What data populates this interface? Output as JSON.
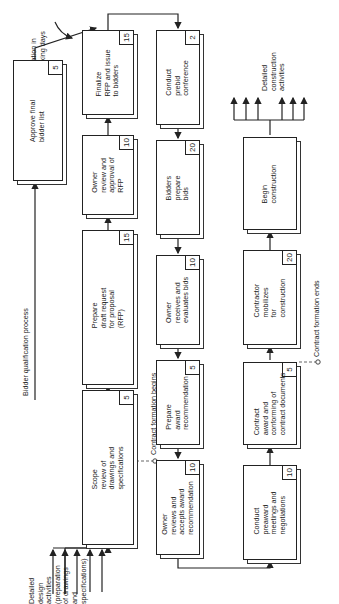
{
  "diagram": {
    "orientation": "rotated-90-ccw",
    "annotations": {
      "duration_note": "Duration in\nworking days",
      "bidder_qualification": "Bidder qualification process",
      "contract_begins": "Contract formation begins",
      "contract_ends": "Contract formation ends",
      "detailed_design": "Detailed\ndesign\nactivities\n(preparation\nof drawings\nand\nspecifications)",
      "detailed_construction": "Detailed\nconstruction\nactivities"
    },
    "activities": [
      {
        "id": "scope",
        "label": "Scope\nreview of\ndrawings and\nspecifications",
        "duration": "5"
      },
      {
        "id": "draft_rfp",
        "label": "Prepare\ndraft request\nfor proposal\n(RFP)",
        "duration": "15"
      },
      {
        "id": "owner_review_rfp",
        "label": "Owner\nreview and\napproval of\nRFP",
        "duration": "10"
      },
      {
        "id": "finalize_rfp",
        "label": "Finalize\nRFP and issue\nto bidders",
        "duration": "15"
      },
      {
        "id": "approve_bidders",
        "label": "Approve final\nbidder list",
        "duration": "5"
      },
      {
        "id": "prebid",
        "label": "Conduct\nprebid\nconference",
        "duration": "2"
      },
      {
        "id": "prepare_bids",
        "label": "Bidders\nprepare\nbids",
        "duration": "20"
      },
      {
        "id": "evaluate_bids",
        "label": "Owner\nreceives and\nevaluates bids",
        "duration": "10"
      },
      {
        "id": "award_rec",
        "label": "Prepare\naward\nrecommendation",
        "duration": "5"
      },
      {
        "id": "accept_award",
        "label": "Owner\nreviews and\naccepts award\nrecommendation",
        "duration": "10"
      },
      {
        "id": "preaward",
        "label": "Conduct\npreaward\nmeetings and\nnegotiations",
        "duration": "10"
      },
      {
        "id": "contract_award",
        "label": "Contract\naward and\nconforming of\ncontract documents",
        "duration": "5"
      },
      {
        "id": "mobilize",
        "label": "Contractor\nmobilizes\nfor\nconstruction",
        "duration": "20"
      },
      {
        "id": "begin_construction",
        "label": "Begin\nconstruction",
        "duration": ""
      }
    ]
  }
}
